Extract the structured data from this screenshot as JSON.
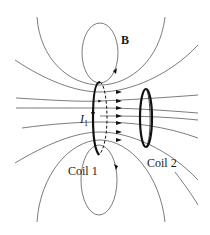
{
  "diagram": {
    "labels": {
      "field": "B",
      "current_symbol": "I",
      "current_subscript": "1",
      "coil1": "Coil 1",
      "coil2": "Coil 2"
    },
    "colors": {
      "lines": "#333333",
      "coils": "#111111",
      "background": "#ffffff"
    },
    "elements": {
      "coil1": "thick vertical loop at x≈100, current I1 flowing downward on front",
      "coil2": "smaller thick vertical loop at x≈146",
      "field_lines": "magnetic field lines passing through both coils, arrows pointing toward coil 1",
      "top_loop": "closed field loop above coil 1",
      "bottom_loop": "closed field loop below coil 1"
    }
  }
}
